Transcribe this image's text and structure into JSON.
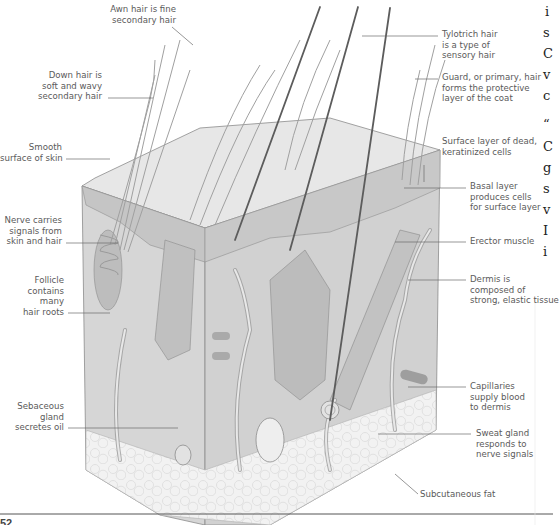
{
  "figure": {
    "labels_left": [
      {
        "id": "awn-hair",
        "text": "Awn hair is fine\nsecondary hair"
      },
      {
        "id": "down-hair",
        "text": "Down hair is\nsoft and wavy\nsecondary hair"
      },
      {
        "id": "smooth-surface",
        "text": "Smooth\nsurface of skin"
      },
      {
        "id": "nerve",
        "text": "Nerve carries\nsignals from\nskin and hair"
      },
      {
        "id": "follicle",
        "text": "Follicle\ncontains\nmany\nhair roots"
      },
      {
        "id": "sebaceous-gland",
        "text": "Sebaceous\ngland\nsecretes oil"
      }
    ],
    "labels_right": [
      {
        "id": "tylotrich-hair",
        "text": "Tylotrich hair\nis a type of\nsensory hair"
      },
      {
        "id": "guard-hair",
        "text": "Guard, or primary, hair\nforms the protective\nlayer of the coat"
      },
      {
        "id": "surface-layer",
        "text": "Surface layer of dead,\nkeratinized cells"
      },
      {
        "id": "basal-layer",
        "text": "Basal layer\nproduces cells\nfor surface layer"
      },
      {
        "id": "erector-muscle",
        "text": "Erector muscle"
      },
      {
        "id": "dermis",
        "text": "Dermis is\ncomposed of\nstrong, elastic tissue"
      },
      {
        "id": "capillaries",
        "text": "Capillaries\nsupply blood\nto dermis"
      },
      {
        "id": "sweat-gland",
        "text": "Sweat gland\nresponds to\nnerve signals"
      },
      {
        "id": "subcutaneous-fat",
        "text": "Subcutaneous fat"
      }
    ],
    "colors": {
      "skin_top": "#e6e6e6",
      "skin_front": "#d4d4d4",
      "skin_side": "#cfcfcf",
      "epidermis": "#c4c4c4",
      "fat": "#f1f1f1",
      "outline": "#8a8a8a",
      "hair": "#9a9a9a",
      "hair_dark": "#5e5e5e",
      "vessel": "#b5b5b5",
      "leader": "#6a6a6a"
    }
  },
  "adjacent_page": {
    "fragments": [
      "i",
      "s",
      "C",
      "v",
      "c",
      "“",
      "C",
      "g",
      "s",
      "v",
      "I",
      "i"
    ]
  },
  "page_number": "52"
}
